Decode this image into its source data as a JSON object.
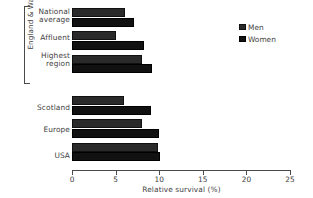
{
  "chart_data": {
    "type": "bar",
    "orientation": "horizontal",
    "title": "",
    "xlabel": "Relative survival (%)",
    "ylabel": "",
    "xlim": [
      0,
      25
    ],
    "xticks": [
      0,
      5,
      10,
      15,
      20,
      25
    ],
    "xtick_labels": [
      "0",
      "5",
      "10",
      "15",
      "20",
      "25"
    ],
    "grid": false,
    "legend_position": "top-right",
    "categories": [
      "National average",
      "Affluent",
      "Highest region",
      "Scotland",
      "Europe",
      "USA"
    ],
    "group_bracket": {
      "label": "England & Wales",
      "covers": [
        "National average",
        "Affluent",
        "Highest region"
      ]
    },
    "series": [
      {
        "name": "Men",
        "color": "#2a2a2a",
        "values": [
          6.1,
          5.0,
          8.0,
          6.0,
          8.0,
          9.9
        ]
      },
      {
        "name": "Women",
        "color": "#111111",
        "values": [
          7.1,
          8.2,
          9.2,
          9.1,
          10.0,
          10.1
        ]
      }
    ]
  },
  "axis": {
    "x_title": "Relative survival (%)"
  },
  "legend": {
    "items": [
      {
        "label": "Men"
      },
      {
        "label": "Women"
      }
    ]
  },
  "labels": {
    "bracket_label": "England & Wales",
    "cat_0_line1": "National",
    "cat_0_line2": "average",
    "cat_1": "Affluent",
    "cat_2_line1": "Highest",
    "cat_2_line2": "region",
    "cat_3": "Scotland",
    "cat_4": "Europe",
    "cat_5": "USA"
  }
}
